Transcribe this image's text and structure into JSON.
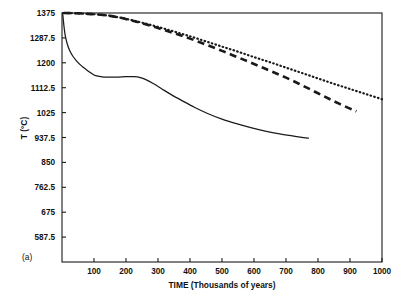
{
  "panel": {
    "label": "(a)"
  },
  "chart_data": {
    "type": "line",
    "title": "",
    "subtitle": "",
    "xlabel": "TIME  (Thousands of years)",
    "ylabel": "T (°C)",
    "xlim": [
      0,
      1000
    ],
    "ylim": [
      500,
      1375
    ],
    "grid": false,
    "legend_position": "none",
    "xticks": [
      100,
      200,
      300,
      400,
      500,
      600,
      700,
      800,
      900,
      1000
    ],
    "xtick_labels": [
      "100",
      "200",
      "300",
      "400",
      "500",
      "600",
      "700",
      "800",
      "900",
      "1000"
    ],
    "yticks": [
      587.5,
      675,
      762.5,
      850,
      937.5,
      1025,
      1112.5,
      1200,
      1287.5,
      1375
    ],
    "ytick_labels": [
      "587.5",
      "675",
      "762.5",
      "850",
      "937.5",
      "1025",
      "1112.5",
      "1200",
      "1287.5",
      "1375"
    ],
    "series": [
      {
        "name": "solid-curve",
        "style": "solid",
        "x": [
          2,
          6,
          10,
          16,
          24,
          34,
          46,
          60,
          76,
          92,
          100,
          112,
          130,
          150,
          175,
          200,
          225,
          245,
          262,
          285,
          310,
          340,
          375,
          415,
          455,
          500,
          545,
          590,
          635,
          680,
          720,
          755,
          770
        ],
        "y": [
          1375,
          1330,
          1296,
          1268,
          1243,
          1223,
          1206,
          1190,
          1176,
          1163,
          1157,
          1153,
          1150,
          1150,
          1150,
          1151,
          1151,
          1148,
          1141,
          1127,
          1110,
          1089,
          1067,
          1043,
          1022,
          1002,
          986,
          972,
          960,
          950,
          943,
          937,
          935
        ]
      },
      {
        "name": "dashed-curve",
        "style": "dashed",
        "x": [
          5,
          40,
          80,
          120,
          150,
          180,
          210,
          250,
          300,
          350,
          400,
          450,
          500,
          550,
          600,
          650,
          700,
          750,
          800,
          850,
          900,
          920
        ],
        "y": [
          1375,
          1374,
          1372,
          1369,
          1365,
          1359,
          1351,
          1339,
          1322,
          1304,
          1285,
          1264,
          1242,
          1219,
          1196,
          1172,
          1148,
          1121,
          1093,
          1065,
          1039,
          1030
        ]
      },
      {
        "name": "dotted-curve",
        "style": "dotted",
        "x": [
          5,
          40,
          80,
          120,
          150,
          180,
          210,
          250,
          300,
          350,
          400,
          450,
          500,
          550,
          600,
          650,
          700,
          750,
          800,
          850,
          900,
          950,
          1000
        ],
        "y": [
          1375,
          1374,
          1372,
          1369,
          1365,
          1359,
          1352,
          1341,
          1326,
          1310,
          1293,
          1275,
          1257,
          1239,
          1220,
          1202,
          1183,
          1164,
          1145,
          1126,
          1108,
          1090,
          1072
        ]
      }
    ]
  }
}
